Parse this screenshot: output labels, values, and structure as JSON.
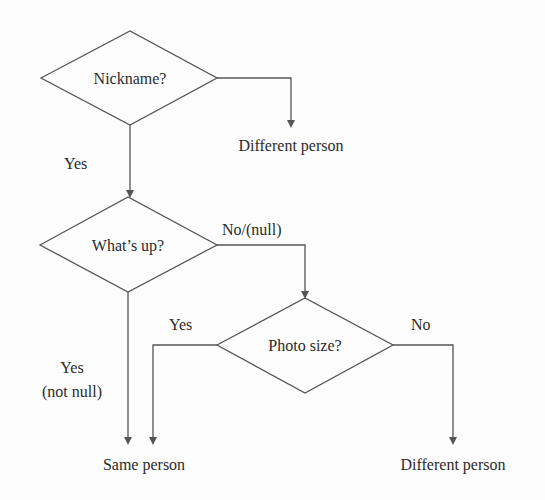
{
  "diagram": {
    "decisions": [
      {
        "id": "nickname",
        "label": "Nickname?"
      },
      {
        "id": "whats_up",
        "label": "What’s up?"
      },
      {
        "id": "photo_size",
        "label": "Photo size?"
      }
    ],
    "outcomes": {
      "top_different": "Different person",
      "same": "Same person",
      "bottom_different": "Different person"
    },
    "edges": {
      "nickname_yes": "Yes",
      "whatsup_no": "No/(null)",
      "whatsup_yes_line1": "Yes",
      "whatsup_yes_line2": "(not null)",
      "photo_yes": "Yes",
      "photo_no": "No"
    },
    "colors": {
      "stroke": "#555555",
      "text": "#2b2b2b",
      "background": "#fdfdfd"
    }
  }
}
